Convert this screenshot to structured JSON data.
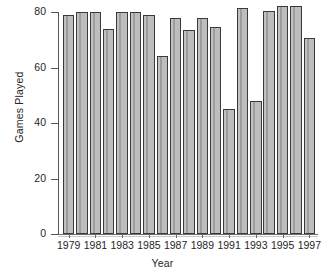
{
  "chart_data": {
    "type": "bar",
    "title": "",
    "xlabel": "Year",
    "ylabel": "Games Played",
    "categories": [
      "1979",
      "1980",
      "1981",
      "1982",
      "1983",
      "1984",
      "1985",
      "1986",
      "1987",
      "1988",
      "1989",
      "1990",
      "1991",
      "1992",
      "1993",
      "1994",
      "1995",
      "1996",
      "1997"
    ],
    "values": [
      79,
      80,
      80,
      74,
      80,
      80,
      79,
      64,
      78,
      73.5,
      78,
      74.5,
      45,
      81.5,
      48,
      80.5,
      82,
      82,
      70.5
    ],
    "ylim": [
      0,
      84
    ],
    "yticks": [
      0,
      20,
      40,
      60,
      80
    ],
    "ytick_labels": [
      "0",
      "20",
      "40",
      "60",
      "80"
    ],
    "xtick_labels": [
      "1979",
      "1981",
      "1983",
      "1985",
      "1987",
      "1989",
      "1991",
      "1993",
      "1995",
      "1997"
    ],
    "xtick_categories": [
      "1979",
      "1981",
      "1983",
      "1985",
      "1987",
      "1989",
      "1991",
      "1993",
      "1995",
      "1997"
    ],
    "grid": false,
    "legend": null,
    "bar_fill_color": "#b5b5b5",
    "bar_edge_color": "#3a3a3a",
    "axis_color": "#555555",
    "background_color": "#ffffff"
  }
}
